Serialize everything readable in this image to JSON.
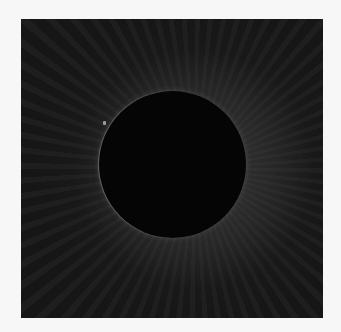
{
  "image": {
    "subject": "total solar eclipse corona",
    "background_color": "#f7f7f7",
    "sky_color": "#161616",
    "moon_color": "#050505"
  }
}
